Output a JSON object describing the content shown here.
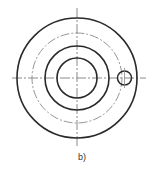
{
  "figure": {
    "label": "b)",
    "center": [
      77,
      78
    ],
    "colors": {
      "solid": "#2a2a2a",
      "centerline": "#8a8a8a"
    },
    "circles": [
      {
        "name": "outer-circle",
        "r": 60,
        "style": "solid"
      },
      {
        "name": "pitch-circle",
        "r": 45,
        "style": "dashdot"
      },
      {
        "name": "middle-circle",
        "r": 32,
        "style": "solid"
      },
      {
        "name": "inner-circle",
        "r": 20,
        "style": "solid"
      }
    ],
    "hole": {
      "cx": 124.5,
      "cy": 78,
      "r": 7
    },
    "centerlines": {
      "horizontal": {
        "x1": 12,
        "x2": 146,
        "y": 78
      },
      "vertical": {
        "x": 77,
        "y1": 8,
        "y2": 147
      }
    }
  }
}
